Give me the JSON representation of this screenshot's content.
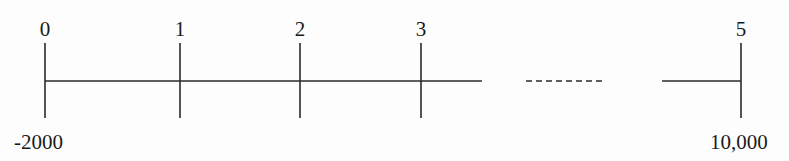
{
  "diagram": {
    "type": "cash-flow-timeline",
    "periods": [
      {
        "label": "0",
        "x": 45
      },
      {
        "label": "1",
        "x": 180
      },
      {
        "label": "2",
        "x": 300
      },
      {
        "label": "3",
        "x": 421
      },
      {
        "label": "5",
        "x": 741
      }
    ],
    "cash_flows": [
      {
        "period": "0",
        "amount": "-2000"
      },
      {
        "period": "5",
        "amount": "10,000"
      }
    ],
    "gap": {
      "style": "dashed",
      "between": [
        "3",
        "5"
      ]
    },
    "colors": {
      "line": "#2a2a2a",
      "text": "#1a1a1a",
      "background": "#fdfdfd"
    }
  }
}
